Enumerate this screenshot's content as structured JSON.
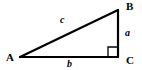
{
  "diagram": {
    "kind": "right-triangle",
    "background_color": "#ffffff",
    "stroke_color": "#000000",
    "stroke_width": 2,
    "width": 142,
    "height": 70,
    "vertices": [
      {
        "id": "A",
        "label": "A",
        "x": 20,
        "y": 57,
        "position": "bottom-left"
      },
      {
        "id": "B",
        "label": "B",
        "x": 118,
        "y": 10,
        "position": "top-right"
      },
      {
        "id": "C",
        "label": "C",
        "x": 118,
        "y": 57,
        "position": "bottom-right"
      }
    ],
    "sides": [
      {
        "id": "a",
        "label": "a",
        "from": "B",
        "to": "C",
        "role": "opposite-leg-vertical"
      },
      {
        "id": "b",
        "label": "b",
        "from": "A",
        "to": "C",
        "role": "adjacent-leg-horizontal"
      },
      {
        "id": "c",
        "label": "c",
        "from": "A",
        "to": "B",
        "role": "hypotenuse"
      }
    ],
    "right_angle": {
      "at_vertex": "C",
      "marker": "square",
      "size": 9,
      "marker_color": "#000000"
    }
  }
}
